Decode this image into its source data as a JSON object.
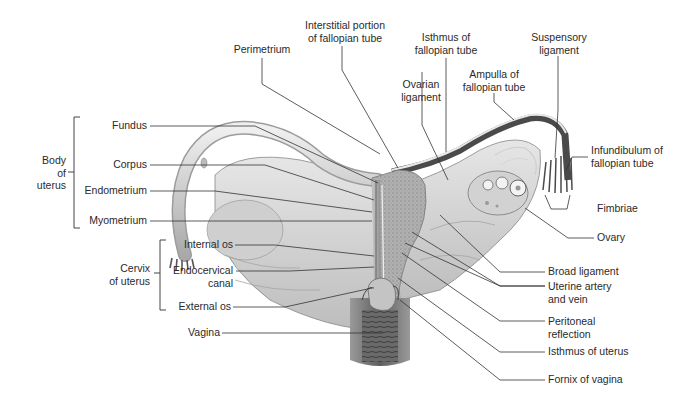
{
  "figure": {
    "colors": {
      "line": "#333333",
      "tissue_light": "#d9d9d9",
      "tissue_mid": "#b5b5b5",
      "tissue_dark": "#6f6f6f",
      "background": "#ffffff"
    }
  },
  "groups": {
    "body_of_uterus": [
      "Body",
      "of",
      "uterus"
    ],
    "cervix_of_uterus": [
      "Cervix",
      "of uterus"
    ]
  },
  "labels": {
    "left": {
      "fundus": "Fundus",
      "corpus": "Corpus",
      "endometrium": "Endometrium",
      "myometrium": "Myometrium",
      "internal_os": "Internal os",
      "endocervical_canal": [
        "Endocervical",
        "canal"
      ],
      "external_os": "External os",
      "vagina": "Vagina"
    },
    "top": {
      "perimetrium": "Perimetrium",
      "interstitial_portion": [
        "Interstitial portion",
        "of fallopian tube"
      ],
      "isthmus_of_tube": [
        "Isthmus of",
        "fallopian tube"
      ],
      "ovarian_ligament": [
        "Ovarian",
        "ligament"
      ],
      "ampulla": [
        "Ampulla of",
        "fallopian tube"
      ],
      "suspensory_ligament": [
        "Suspensory",
        "ligament"
      ]
    },
    "right": {
      "infundibulum": [
        "Infundibulum of",
        "fallopian tube"
      ],
      "fimbriae": "Fimbriae",
      "ovary": "Ovary",
      "broad_ligament": "Broad ligament",
      "uterine_artery_vein": [
        "Uterine artery",
        "and vein"
      ],
      "peritoneal_reflection": [
        "Peritoneal",
        "reflection"
      ],
      "isthmus_of_uterus": "Isthmus of uterus",
      "fornix_of_vagina": "Fornix of vagina"
    }
  }
}
